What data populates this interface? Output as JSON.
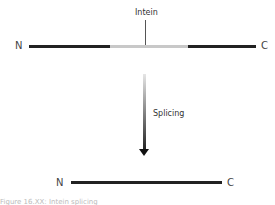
{
  "diagram": {
    "title": "Intein splicing",
    "precursor": {
      "n_label": "N",
      "c_label": "C",
      "intein_label": "Intein",
      "segments": [
        {
          "name": "N-extein",
          "color": "#222222"
        },
        {
          "name": "intein",
          "color": "#c8c8c8"
        },
        {
          "name": "C-extein",
          "color": "#222222"
        }
      ]
    },
    "arrow_label": "Splicing",
    "product": {
      "n_label": "N",
      "c_label": "C",
      "color": "#222222"
    },
    "caption": "Figure 16.XX: Intein splicing"
  }
}
